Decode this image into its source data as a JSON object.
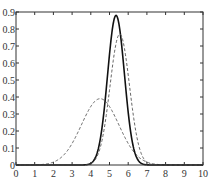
{
  "chart_data": {
    "type": "line",
    "title": "",
    "xlabel": "",
    "ylabel": "",
    "xlim": [
      0,
      10
    ],
    "ylim": [
      0,
      0.9
    ],
    "grid": false,
    "legend": null,
    "x_ticks": [
      "0",
      "1",
      "2",
      "3",
      "4",
      "5",
      "6",
      "7",
      "8",
      "9",
      "10"
    ],
    "y_ticks": [
      "0",
      "0.1",
      "0.2",
      "0.3",
      "0.4",
      "0.5",
      "0.6",
      "0.7",
      "0.8",
      "0.9"
    ],
    "series": [
      {
        "name": "wide-dashed",
        "style": "dashed",
        "color": "#555555",
        "mean": 4.5,
        "sd": 1.0,
        "peak": 0.39
      },
      {
        "name": "narrow-solid",
        "style": "solid",
        "color": "#111111",
        "mean": 5.35,
        "sd": 0.45,
        "peak": 0.88
      },
      {
        "name": "narrow-dashed",
        "style": "dashed",
        "color": "#555555",
        "mean": 5.55,
        "sd": 0.52,
        "peak": 0.77
      }
    ]
  }
}
